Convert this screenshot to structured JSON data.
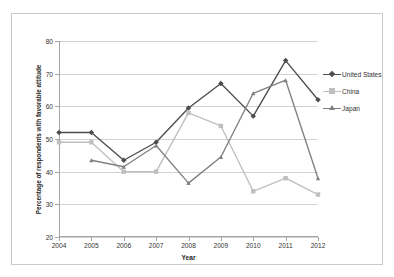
{
  "chart_data": {
    "type": "line",
    "title": "",
    "xlabel": "Year",
    "ylabel": "Percentage of respondents with favorable attitude",
    "x": [
      2004,
      2005,
      2006,
      2007,
      2008,
      2009,
      2010,
      2011,
      2012
    ],
    "xticklabels": [
      "2004",
      "2005",
      "2006",
      "2007",
      "2008",
      "2009",
      "2010",
      "2011",
      "2012"
    ],
    "yticklabels": [
      "20",
      "30",
      "40",
      "50",
      "60",
      "70",
      "80"
    ],
    "yticks": [
      20,
      30,
      40,
      50,
      60,
      70,
      80
    ],
    "ylim": [
      20,
      80
    ],
    "xlim": [
      2004,
      2012
    ],
    "grid": "horizontal",
    "legend_position": "right",
    "series": [
      {
        "name": "United States",
        "color": "#4d4d4d",
        "marker": "diamond",
        "values": [
          52,
          52,
          43.5,
          49,
          59.5,
          67,
          57,
          74,
          62
        ]
      },
      {
        "name": "China",
        "color": "#bfbfbf",
        "marker": "square",
        "values": [
          49,
          49,
          40,
          40,
          58,
          54,
          34,
          38,
          33
        ]
      },
      {
        "name": "Japan",
        "color": "#808080",
        "marker": "triangle",
        "values": [
          null,
          43.5,
          41.5,
          48,
          36.5,
          44.5,
          64,
          68,
          38
        ]
      }
    ]
  },
  "legend": {
    "items": [
      {
        "label": "United States"
      },
      {
        "label": "China"
      },
      {
        "label": "Japan"
      }
    ]
  },
  "axes": {
    "x_title": "Year",
    "y_title": "Percentage of respondents with favorable attitude"
  },
  "colors": {
    "united_states": "#4d4d4d",
    "china": "#bfbfbf",
    "japan": "#808080",
    "grid": "#d2d2d2",
    "axis": "#a6a6a6",
    "frame": "#c9c9c9",
    "text": "#333333"
  }
}
